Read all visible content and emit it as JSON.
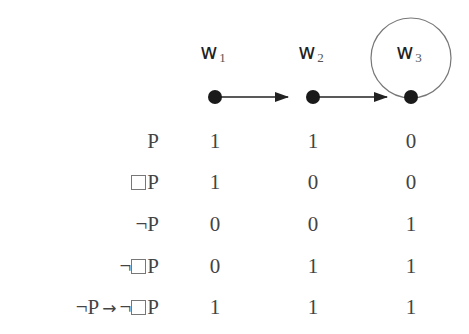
{
  "worlds": [
    {
      "letter": "w",
      "index": "1",
      "x": 215,
      "reflexive": false
    },
    {
      "letter": "w",
      "index": "2",
      "x": 313,
      "reflexive": false
    },
    {
      "letter": "w",
      "index": "3",
      "x": 411,
      "reflexive": true
    }
  ],
  "accessibility": [
    {
      "from": "w1",
      "to": "w2"
    },
    {
      "from": "w2",
      "to": "w3"
    },
    {
      "from": "w3",
      "to": "w3"
    }
  ],
  "table": {
    "rows": [
      {
        "formula_parts": {
          "pre": "",
          "box": false,
          "neg": false,
          "atom": "P"
        },
        "label": "P",
        "values": [
          "1",
          "1",
          "0"
        ]
      },
      {
        "formula_parts": {
          "pre": "",
          "box": true,
          "neg": false,
          "atom": "P"
        },
        "label": "□P",
        "values": [
          "1",
          "0",
          "0"
        ]
      },
      {
        "formula_parts": {
          "pre": "",
          "box": false,
          "neg": true,
          "atom": "P"
        },
        "label": "¬P",
        "values": [
          "0",
          "0",
          "1"
        ]
      },
      {
        "formula_parts": {
          "pre": "",
          "box": true,
          "neg": true,
          "atom": "P"
        },
        "label": "¬□P",
        "values": [
          "0",
          "1",
          "1"
        ]
      },
      {
        "label": "¬P → ¬□P",
        "values": [
          "1",
          "1",
          "1"
        ]
      }
    ]
  },
  "symbols": {
    "neg": "¬",
    "atom": "P",
    "implies": "→"
  },
  "colors": {
    "node": "#1a1a1a",
    "edge": "#222222",
    "loop": "#777777",
    "text": "#444444"
  }
}
